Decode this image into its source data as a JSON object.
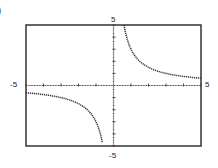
{
  "panel": {
    "label": ")"
  },
  "chart_data": {
    "type": "line",
    "title": "",
    "function": "y = 3/x",
    "xlabel": "",
    "ylabel": "",
    "xlim": [
      -5,
      5
    ],
    "ylim": [
      -5,
      5
    ],
    "x_tick_step": 1,
    "y_tick_step": 1,
    "grid": false,
    "axis_labels": {
      "x_min": "-5",
      "x_max": "5",
      "y_min": "-5",
      "y_max": "5"
    },
    "series": [
      {
        "name": "branch-right",
        "x": [
          0.6,
          0.75,
          1,
          1.5,
          2,
          2.5,
          3,
          3.5,
          4,
          4.5,
          5
        ],
        "y": [
          5,
          4,
          3,
          2,
          1.5,
          1.2,
          1,
          0.86,
          0.75,
          0.67,
          0.6
        ]
      },
      {
        "name": "branch-left",
        "x": [
          -5,
          -4.5,
          -4,
          -3.5,
          -3,
          -2.5,
          -2,
          -1.5,
          -1,
          -0.75,
          -0.6
        ],
        "y": [
          -0.6,
          -0.67,
          -0.75,
          -0.86,
          -1,
          -1.2,
          -1.5,
          -2,
          -3,
          -4,
          -5
        ]
      }
    ],
    "colors": {
      "curve": "#333333",
      "frame": "#333333",
      "axis": "#444444"
    }
  }
}
